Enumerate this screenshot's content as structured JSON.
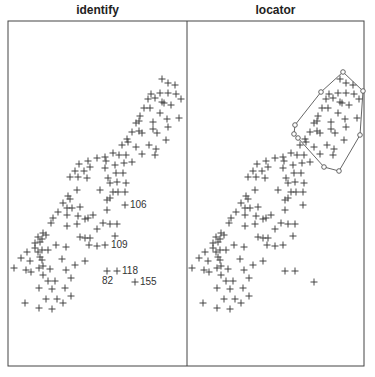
{
  "panels": [
    {
      "title": "identify"
    },
    {
      "title": "locator"
    }
  ],
  "chart_data": [
    {
      "type": "scatter",
      "title": "identify",
      "xlabel": "",
      "ylabel": "",
      "marker": "+",
      "axes": "none",
      "points_px": [
        [
          162,
          79
        ],
        [
          168,
          83
        ],
        [
          175,
          85
        ],
        [
          151,
          94
        ],
        [
          160,
          93
        ],
        [
          168,
          93
        ],
        [
          176,
          94
        ],
        [
          181,
          99
        ],
        [
          148,
          99
        ],
        [
          155,
          98
        ],
        [
          162,
          102
        ],
        [
          164,
          103
        ],
        [
          171,
          105
        ],
        [
          144,
          108
        ],
        [
          150,
          108
        ],
        [
          160,
          113
        ],
        [
          179,
          118
        ],
        [
          140,
          116
        ],
        [
          153,
          122
        ],
        [
          167,
          119
        ],
        [
          136,
          123
        ],
        [
          139,
          121
        ],
        [
          168,
          127
        ],
        [
          132,
          132
        ],
        [
          139,
          131
        ],
        [
          142,
          133
        ],
        [
          153,
          129
        ],
        [
          157,
          133
        ],
        [
          166,
          140
        ],
        [
          127,
          139
        ],
        [
          128,
          142
        ],
        [
          122,
          145
        ],
        [
          136,
          147
        ],
        [
          149,
          145
        ],
        [
          156,
          149
        ],
        [
          142,
          154
        ],
        [
          155,
          155
        ],
        [
          113,
          153
        ],
        [
          119,
          155
        ],
        [
          126,
          155
        ],
        [
          97,
          158
        ],
        [
          105,
          157
        ],
        [
          106,
          161
        ],
        [
          88,
          161
        ],
        [
          79,
          164
        ],
        [
          90,
          167
        ],
        [
          115,
          165
        ],
        [
          124,
          163
        ],
        [
          132,
          162
        ],
        [
          75,
          171
        ],
        [
          84,
          171
        ],
        [
          105,
          168
        ],
        [
          70,
          177
        ],
        [
          78,
          177
        ],
        [
          87,
          178
        ],
        [
          108,
          178
        ],
        [
          116,
          173
        ],
        [
          123,
          173
        ],
        [
          110,
          183
        ],
        [
          117,
          182
        ],
        [
          126,
          183
        ],
        [
          68,
          196
        ],
        [
          70,
          199
        ],
        [
          77,
          190
        ],
        [
          100,
          190
        ],
        [
          113,
          192
        ],
        [
          118,
          192
        ],
        [
          125,
          192
        ],
        [
          107,
          200
        ],
        [
          110,
          198
        ],
        [
          125,
          205
        ],
        [
          63,
          203
        ],
        [
          67,
          208
        ],
        [
          72,
          208
        ],
        [
          80,
          207
        ],
        [
          107,
          210
        ],
        [
          58,
          212
        ],
        [
          67,
          215
        ],
        [
          78,
          216
        ],
        [
          85,
          219
        ],
        [
          88,
          218
        ],
        [
          93,
          215
        ],
        [
          53,
          218
        ],
        [
          51,
          223
        ],
        [
          67,
          226
        ],
        [
          77,
          224
        ],
        [
          103,
          223
        ],
        [
          110,
          224
        ],
        [
          117,
          224
        ],
        [
          97,
          229
        ],
        [
          43,
          233
        ],
        [
          46,
          235
        ],
        [
          38,
          237
        ],
        [
          42,
          239
        ],
        [
          80,
          237
        ],
        [
          85,
          238
        ],
        [
          90,
          238
        ],
        [
          115,
          236
        ],
        [
          35,
          243
        ],
        [
          40,
          242
        ],
        [
          56,
          245
        ],
        [
          66,
          247
        ],
        [
          89,
          245
        ],
        [
          97,
          246
        ],
        [
          105,
          245
        ],
        [
          27,
          252
        ],
        [
          35,
          248
        ],
        [
          38,
          252
        ],
        [
          42,
          250
        ],
        [
          48,
          250
        ],
        [
          21,
          258
        ],
        [
          30,
          261
        ],
        [
          40,
          257
        ],
        [
          42,
          260
        ],
        [
          62,
          259
        ],
        [
          75,
          265
        ],
        [
          85,
          261
        ],
        [
          14,
          268
        ],
        [
          26,
          270
        ],
        [
          31,
          272
        ],
        [
          39,
          268
        ],
        [
          43,
          266
        ],
        [
          50,
          269
        ],
        [
          66,
          270
        ],
        [
          107,
          271
        ],
        [
          117,
          271
        ],
        [
          135,
          282
        ],
        [
          43,
          275
        ],
        [
          71,
          278
        ],
        [
          48,
          281
        ],
        [
          55,
          281
        ],
        [
          39,
          288
        ],
        [
          52,
          289
        ],
        [
          65,
          288
        ],
        [
          71,
          296
        ],
        [
          25,
          303
        ],
        [
          46,
          299
        ],
        [
          57,
          299
        ],
        [
          63,
          303
        ],
        [
          39,
          308
        ],
        [
          52,
          309
        ]
      ],
      "annotations": [
        {
          "label": "106",
          "x": 130,
          "y": 208
        },
        {
          "label": "109",
          "x": 111,
          "y": 248
        },
        {
          "label": "118",
          "x": 122,
          "y": 274
        },
        {
          "label": "82",
          "x": 102,
          "y": 284
        },
        {
          "label": "155",
          "x": 140,
          "y": 285
        }
      ]
    },
    {
      "type": "scatter",
      "title": "locator",
      "xlabel": "",
      "ylabel": "",
      "marker": "+",
      "axes": "none",
      "x_offset_px": 178,
      "polygon_px": [
        [
          343,
          72
        ],
        [
          363,
          91
        ],
        [
          360,
          135
        ],
        [
          339,
          171
        ],
        [
          324,
          167
        ],
        [
          298,
          138
        ],
        [
          294,
          134
        ],
        [
          295,
          125
        ],
        [
          321,
          92
        ]
      ],
      "extra_points_px": [
        [
          314,
          282
        ]
      ]
    }
  ]
}
